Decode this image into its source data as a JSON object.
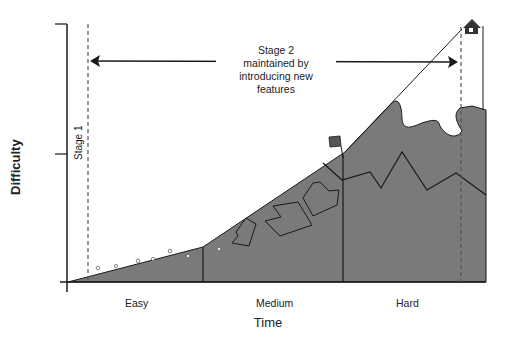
{
  "figure": {
    "y_axis_label": "Difficulty",
    "x_axis_label": "Time",
    "stage1_label": "Stage 1",
    "stage2_label_lines": [
      "Stage 2",
      "maintained by",
      "introducing new",
      "features"
    ],
    "categories": [
      "Easy",
      "Medium",
      "Hard"
    ],
    "icons": [
      "flag-icon",
      "house-icon"
    ],
    "colors": {
      "fill": "#7a7a7a",
      "line": "#1a1a1a",
      "background": "#ffffff"
    }
  }
}
